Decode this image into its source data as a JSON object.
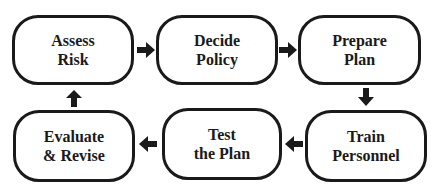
{
  "diagram": {
    "type": "cycle-flowchart",
    "nodes": [
      {
        "id": "assess",
        "line1": "Assess",
        "line2": "Risk"
      },
      {
        "id": "decide",
        "line1": "Decide",
        "line2": "Policy"
      },
      {
        "id": "prepare",
        "line1": "Prepare",
        "line2": "Plan"
      },
      {
        "id": "train",
        "line1": "Train",
        "line2": "Personnel"
      },
      {
        "id": "test",
        "line1": "Test",
        "line2": "the Plan"
      },
      {
        "id": "evaluate",
        "line1": "Evaluate",
        "line2": "& Revise"
      }
    ],
    "edges": [
      {
        "from": "assess",
        "to": "decide",
        "direction": "right"
      },
      {
        "from": "decide",
        "to": "prepare",
        "direction": "right"
      },
      {
        "from": "prepare",
        "to": "train",
        "direction": "down"
      },
      {
        "from": "train",
        "to": "test",
        "direction": "left"
      },
      {
        "from": "test",
        "to": "evaluate",
        "direction": "left"
      },
      {
        "from": "evaluate",
        "to": "assess",
        "direction": "up"
      }
    ],
    "colors": {
      "stroke": "#1a1a1a",
      "fill": "#ffffff",
      "text": "#1a1a1a"
    }
  }
}
